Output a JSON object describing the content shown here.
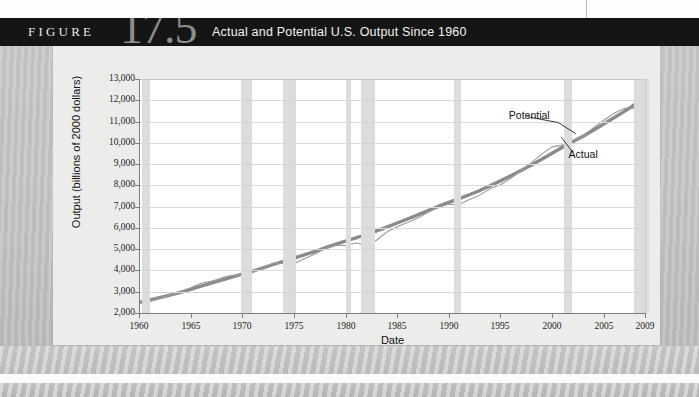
{
  "figure": {
    "word": "FIGURE",
    "number": "17.5",
    "caption": "Actual and Potential U.S. Output Since 1960"
  },
  "chart_data": {
    "type": "line",
    "title": "Actual and Potential U.S. Output Since 1960",
    "xlabel": "Date",
    "ylabel": "Output (billions of 2000 dollars)",
    "xlim": [
      1960,
      2009
    ],
    "ylim": [
      2000,
      13000
    ],
    "grid": true,
    "legend_position": "inline-annotation",
    "ytick_labels": [
      "2,000",
      "3,000",
      "4,000",
      "5,000",
      "6,000",
      "7,000",
      "8,000",
      "9,000",
      "10,000",
      "11,000",
      "12,000",
      "13,000"
    ],
    "ytick_values": [
      2000,
      3000,
      4000,
      5000,
      6000,
      7000,
      8000,
      9000,
      10000,
      11000,
      12000,
      13000
    ],
    "xtick_labels": [
      "1960",
      "1965",
      "1970",
      "1975",
      "1980",
      "1985",
      "1990",
      "1995",
      "2000",
      "2005",
      "2009"
    ],
    "xtick_values": [
      1960,
      1965,
      1970,
      1975,
      1980,
      1985,
      1990,
      1995,
      2000,
      2005,
      2009
    ],
    "annotations": [
      {
        "label": "Potential",
        "series": "potential"
      },
      {
        "label": "Actual",
        "series": "actual"
      }
    ],
    "recession_bands": [
      {
        "start": 1960.3,
        "end": 1961.1
      },
      {
        "start": 1969.9,
        "end": 1970.9
      },
      {
        "start": 1973.9,
        "end": 1975.2
      },
      {
        "start": 1980.0,
        "end": 1980.5
      },
      {
        "start": 1981.5,
        "end": 1982.9
      },
      {
        "start": 1990.5,
        "end": 1991.2
      },
      {
        "start": 2001.2,
        "end": 2001.9
      },
      {
        "start": 2007.9,
        "end": 2009.4
      }
    ],
    "series": [
      {
        "name": "Potential",
        "style": "thick",
        "color": "#8a8a8a",
        "x": [
          1960,
          1961,
          1962,
          1963,
          1964,
          1965,
          1966,
          1967,
          1968,
          1969,
          1970,
          1971,
          1972,
          1973,
          1974,
          1975,
          1976,
          1977,
          1978,
          1979,
          1980,
          1981,
          1982,
          1983,
          1984,
          1985,
          1986,
          1987,
          1988,
          1989,
          1990,
          1991,
          1992,
          1993,
          1994,
          1995,
          1996,
          1997,
          1998,
          1999,
          2000,
          2001,
          2002,
          2003,
          2004,
          2005,
          2006,
          2007,
          2008,
          2009
        ],
        "values": [
          2500,
          2600,
          2720,
          2840,
          2970,
          3110,
          3260,
          3400,
          3540,
          3690,
          3830,
          3970,
          4120,
          4280,
          4430,
          4580,
          4730,
          4890,
          5060,
          5230,
          5380,
          5530,
          5690,
          5860,
          6040,
          6230,
          6420,
          6610,
          6810,
          7010,
          7200,
          7380,
          7560,
          7760,
          7980,
          8210,
          8450,
          8700,
          8960,
          9230,
          9510,
          9790,
          10050,
          10310,
          10590,
          10880,
          11180,
          11480,
          11790,
          12180
        ]
      },
      {
        "name": "Actual",
        "style": "thin",
        "color": "#9a9a9a",
        "x": [
          1960,
          1961,
          1962,
          1963,
          1964,
          1965,
          1966,
          1967,
          1968,
          1969,
          1970,
          1971,
          1972,
          1973,
          1974,
          1975,
          1976,
          1977,
          1978,
          1979,
          1980,
          1981,
          1982,
          1983,
          1984,
          1985,
          1986,
          1987,
          1988,
          1989,
          1990,
          1991,
          1992,
          1993,
          1994,
          1995,
          1996,
          1997,
          1998,
          1999,
          2000,
          2001,
          2002,
          2003,
          2004,
          2005,
          2006,
          2007,
          2008,
          2009
        ],
        "values": [
          2500,
          2560,
          2720,
          2840,
          3000,
          3190,
          3400,
          3490,
          3650,
          3770,
          3780,
          3900,
          4110,
          4350,
          4330,
          4320,
          4550,
          4760,
          5020,
          5180,
          5170,
          5290,
          5190,
          5420,
          5810,
          6050,
          6260,
          6470,
          6740,
          6990,
          7110,
          7100,
          7340,
          7540,
          7840,
          8030,
          8330,
          8700,
          9070,
          9470,
          9810,
          9890,
          10050,
          10320,
          10700,
          11050,
          11390,
          11620,
          11630,
          11370
        ]
      }
    ]
  }
}
